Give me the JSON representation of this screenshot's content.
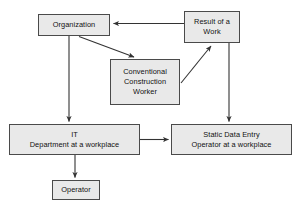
{
  "diagram": {
    "type": "flowchart",
    "background_color": "#ffffff",
    "node_fill_color": "#e9e9e9",
    "node_border_color": "#4a4a4a",
    "edge_color": "#333333",
    "nodes": [
      {
        "id": "organization",
        "lines": [
          "Organization"
        ]
      },
      {
        "id": "result_of_a_work",
        "lines": [
          "Result of a",
          "Work"
        ]
      },
      {
        "id": "conventional",
        "lines": [
          "Conventional",
          "Construction",
          "Worker"
        ]
      },
      {
        "id": "it_department",
        "lines": [
          "IT",
          "Department at a workplace"
        ]
      },
      {
        "id": "static_data_entry",
        "lines": [
          "Static Data Entry",
          "Operator at a workplace"
        ]
      },
      {
        "id": "operator",
        "lines": [
          "Operator"
        ]
      }
    ],
    "edges": [
      {
        "id": "result-to-organization",
        "from": "result_of_a_work",
        "to": "organization",
        "style": "horizontal-left"
      },
      {
        "id": "organization-to-conventional",
        "from": "organization",
        "to": "conventional",
        "style": "diagonal-down-right"
      },
      {
        "id": "conventional-to-result",
        "from": "conventional",
        "to": "result_of_a_work",
        "style": "diagonal-up-right"
      },
      {
        "id": "organization-to-it",
        "from": "organization",
        "to": "it_department",
        "style": "vertical-down"
      },
      {
        "id": "result-to-static-data-entry",
        "from": "result_of_a_work",
        "to": "static_data_entry",
        "style": "vertical-down"
      },
      {
        "id": "it-to-static-data-entry",
        "from": "it_department",
        "to": "static_data_entry",
        "style": "horizontal-right"
      },
      {
        "id": "it-to-operator",
        "from": "it_department",
        "to": "operator",
        "style": "vertical-down"
      }
    ]
  }
}
